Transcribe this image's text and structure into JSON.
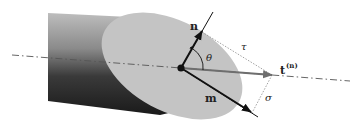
{
  "figure": {
    "labels": {
      "normal": "n",
      "tangent": "m",
      "traction": "t",
      "traction_superscript": "(n)",
      "angle": "θ",
      "shear_component": "τ",
      "normal_component": "σ"
    },
    "colors": {
      "background": "#ffffff",
      "cylinder_light": "#b5b5b5",
      "cylinder_dark": "#1c1c1c",
      "cut_plane": "#c4c4c4",
      "vector": "#111111",
      "traction_vector": "#6e6e6e",
      "projection_lines": "#8a8a8a",
      "axis_line": "#555555"
    }
  }
}
